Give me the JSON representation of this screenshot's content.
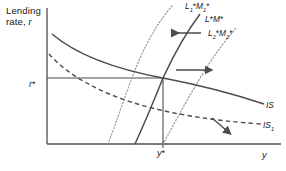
{
  "figure": {
    "type": "is-lm-diagram",
    "background_color": "#ffffff"
  },
  "axes": {
    "y_axis_title": "Lending rate, r",
    "y_axis_title_line1": "Lending",
    "y_axis_title_line2": "rate, r",
    "x_axis_title": "y",
    "y_tick_label": "r*",
    "x_tick_label": "y*",
    "origin_px": [
      47,
      144
    ],
    "x_axis_end_px": [
      281,
      144
    ],
    "y_axis_top_px": [
      47,
      8
    ],
    "axis_color": "#4d4d4d"
  },
  "equilibrium": {
    "x_px": 163,
    "y_px": 78,
    "x_label": "y*",
    "y_label": "r*"
  },
  "curves": [
    {
      "name": "LM-shifted-left",
      "label": "L1*M1*",
      "label_text": "L",
      "label_sub1": "1",
      "label_mid": "*M",
      "label_sub2": "1",
      "label_end": "*",
      "style": "dotted",
      "slope": "upward",
      "color": "#999999"
    },
    {
      "name": "LM-baseline",
      "label": "L*M*",
      "style": "solid",
      "slope": "upward",
      "color": "#4d4d4d"
    },
    {
      "name": "LM-shifted-right",
      "label": "L2*M2*",
      "label_text": "L",
      "label_sub1": "2",
      "label_mid": "*M",
      "label_sub2": "2",
      "label_end": "*",
      "style": "dotted",
      "slope": "upward",
      "color": "#999999"
    },
    {
      "name": "IS-baseline",
      "label": "IS",
      "style": "solid",
      "slope": "downward",
      "color": "#4d4d4d"
    },
    {
      "name": "IS-shifted",
      "label": "IS1",
      "label_text": "IS",
      "label_sub": "1",
      "style": "dashed",
      "slope": "downward",
      "color": "#4d4d4d"
    }
  ],
  "arrows": [
    {
      "name": "leftward-shift-arrow",
      "direction": "left",
      "from_px": [
        201,
        33
      ],
      "to_px": [
        168,
        33
      ]
    },
    {
      "name": "rightward-shift-arrow",
      "direction": "right",
      "from_px": [
        176,
        70
      ],
      "to_px": [
        210,
        70
      ]
    },
    {
      "name": "downward-shift-arrow",
      "direction": "down-right",
      "from_px": [
        212,
        118
      ],
      "to_px": [
        229,
        132
      ]
    }
  ],
  "labels": {
    "lm_left": "L",
    "lm_base": "L*M*",
    "is_base": "IS",
    "is_shift": "IS"
  }
}
